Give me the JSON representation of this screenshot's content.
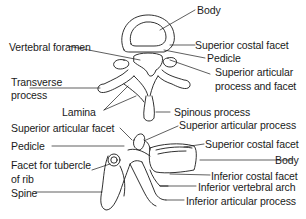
{
  "diagram": {
    "views": [
      {
        "name": "superior view",
        "labels": [
          {
            "id": "body-top",
            "text": "Body"
          },
          {
            "id": "vertebral-foramen",
            "text": "Vertebral foramen"
          },
          {
            "id": "superior-costal-facet-top",
            "text": "Superior costal facet"
          },
          {
            "id": "pedicle-top",
            "text": "Pedicle"
          },
          {
            "id": "transverse-process-1",
            "text": "Transverse"
          },
          {
            "id": "transverse-process-2",
            "text": "process"
          },
          {
            "id": "sup-articular-process-facet-1",
            "text": "Superior articular"
          },
          {
            "id": "sup-articular-process-facet-2",
            "text": "process and facet"
          },
          {
            "id": "lamina",
            "text": "Lamina"
          },
          {
            "id": "spinous-process",
            "text": "Spinous process"
          }
        ]
      },
      {
        "name": "lateral view",
        "labels": [
          {
            "id": "superior-articular-facet",
            "text": "Superior articular facet"
          },
          {
            "id": "superior-articular-process",
            "text": "Superior articular process"
          },
          {
            "id": "pedicle-side",
            "text": "Pedicle"
          },
          {
            "id": "superior-costal-facet-side",
            "text": "Superior costal facet"
          },
          {
            "id": "body-side",
            "text": "Body"
          },
          {
            "id": "facet-tubercle-1",
            "text": "Facet for tubercle"
          },
          {
            "id": "facet-tubercle-2",
            "text": "of rib"
          },
          {
            "id": "inferior-costal-facet",
            "text": "Inferior costal facet"
          },
          {
            "id": "inferior-vertebral-arch",
            "text": "Inferior vertebral arch"
          },
          {
            "id": "spine",
            "text": "Spine"
          },
          {
            "id": "inferior-articular-process",
            "text": "Inferior articular process"
          }
        ]
      }
    ],
    "colors": {
      "line": "#1a1a1a",
      "background": "#ffffff"
    }
  }
}
